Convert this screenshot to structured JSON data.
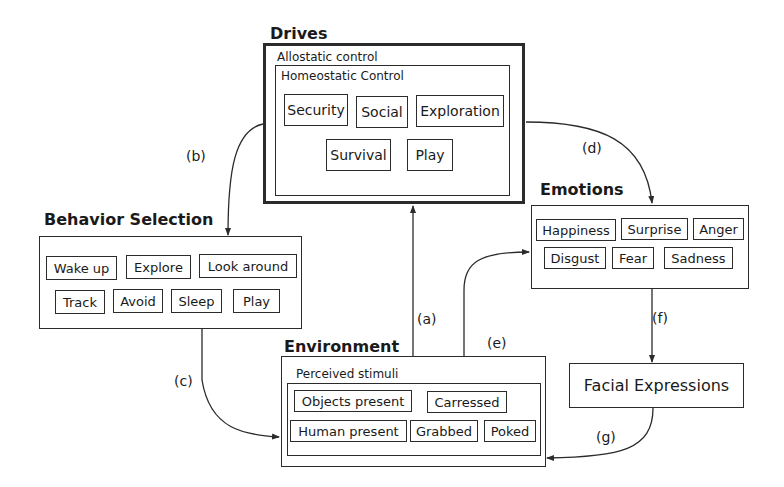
{
  "drives": {
    "title": "Drives",
    "outer_label": "Allostatic control",
    "inner_label": "Homeostatic Control",
    "items": [
      "Security",
      "Social",
      "Exploration",
      "Survival",
      "Play"
    ]
  },
  "behavior_selection": {
    "title": "Behavior Selection",
    "items": [
      "Wake up",
      "Explore",
      "Look around",
      "Track",
      "Avoid",
      "Sleep",
      "Play"
    ]
  },
  "emotions": {
    "title": "Emotions",
    "items": [
      "Happiness",
      "Surprise",
      "Anger",
      "Disgust",
      "Fear",
      "Sadness"
    ]
  },
  "environment": {
    "title": "Environment",
    "inner_label": "Perceived stimuli",
    "items": [
      "Objects present",
      "Carressed",
      "Human present",
      "Grabbed",
      "Poked"
    ]
  },
  "facial_expressions": {
    "label": "Facial Expressions"
  },
  "edges": {
    "a": "(a)",
    "b": "(b)",
    "c": "(c)",
    "d": "(d)",
    "e": "(e)",
    "f": "(f)",
    "g": "(g)"
  },
  "colors": {
    "stroke": "#2b2b2b",
    "background": "#ffffff"
  }
}
